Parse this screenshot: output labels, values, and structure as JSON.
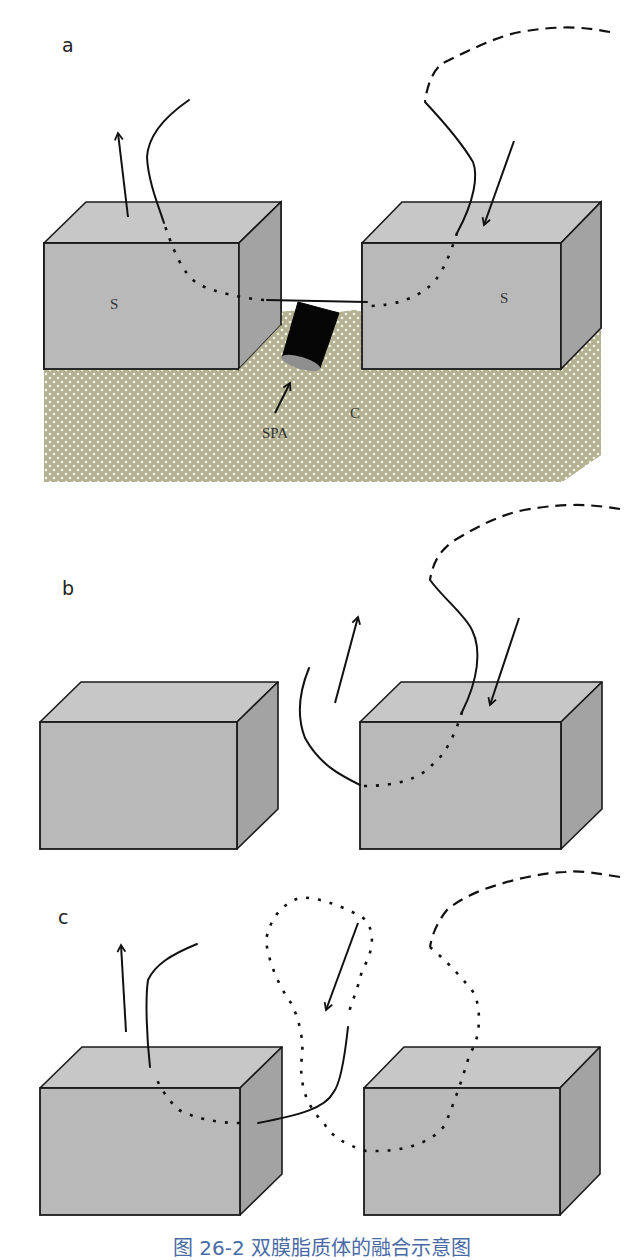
{
  "figure": {
    "caption": "图 26-2  双膜脂质体的融合示意图",
    "caption_note": "caption is clipped at bottom edge of screenshot; only the top sliver is visible",
    "colors": {
      "box_top": "#c7c7c7",
      "box_front": "#b9b9b9",
      "box_side": "#a3a3a3",
      "box_stroke": "#1a1a1a",
      "substrate": "#b4b293",
      "substrate_dot": "#f4f4e8",
      "line": "#111111",
      "cylinder": "#050505",
      "cylinder_base": "#8f8f8f",
      "caption": "#4a6aa6"
    },
    "panels": [
      {
        "id": "a",
        "label": "a",
        "label_pos": [
          62,
          52
        ],
        "substrate": {
          "points": [
            [
              44,
              369
            ],
            [
              238,
              369
            ],
            [
              280,
              325
            ],
            [
              280,
              312
            ],
            [
              300,
              310
            ],
            [
              340,
              312
            ],
            [
              355,
              310
            ],
            [
              362,
              312
            ],
            [
              362,
              369
            ],
            [
              561,
              369
            ],
            [
              601,
              328
            ],
            [
              601,
              455
            ],
            [
              562,
              482
            ],
            [
              44,
              482
            ]
          ]
        },
        "boxes": [
          {
            "x": 44,
            "y": 243,
            "w": 195,
            "h": 126,
            "dx": 42,
            "dy": -41,
            "clip_side_to": 325
          },
          {
            "x": 362,
            "y": 243,
            "w": 199,
            "h": 126,
            "dx": 40,
            "dy": -41,
            "clip_side_to": 328
          }
        ],
        "cylinder": {
          "points": [
            [
              298,
              302
            ],
            [
              339,
              313
            ],
            [
              320,
              368
            ],
            [
              282,
              358
            ]
          ],
          "base": {
            "cx": 301,
            "cy": 363,
            "rx": 20,
            "ry": 6,
            "angle": 17
          }
        },
        "texts": [
          {
            "text": "S",
            "x": 110,
            "y": 309,
            "cls": "serif"
          },
          {
            "text": "S",
            "x": 500,
            "y": 303,
            "cls": "serif"
          },
          {
            "text": "SPA",
            "x": 262,
            "y": 438,
            "cls": "serif"
          },
          {
            "text": "C",
            "x": 350,
            "y": 418,
            "cls": "serif"
          }
        ],
        "paths": [
          {
            "style": "dashed",
            "d": "M610,32 C585,27 560,25 520,32 C495,37 470,50 443,63 C433,70 427,85 425,102"
          },
          {
            "style": "solid",
            "d": "M425,102 C440,118 460,140 473,162 C478,175 475,200 457,233"
          },
          {
            "style": "dotted",
            "d": "M457,233 C450,255 440,280 427,288 C415,298 395,306 367,306"
          },
          {
            "style": "solid",
            "d": "M367,302 L267,300"
          },
          {
            "style": "dotted",
            "d": "M264,300 C240,298 215,292 200,285 C188,278 178,265 164,223"
          },
          {
            "style": "solid",
            "d": "M164,223 C158,205 148,180 147,157 C148,140 160,120 189,100"
          }
        ],
        "arrows": [
          {
            "from": [
              128,
              217
            ],
            "to": [
              118,
              133
            ]
          },
          {
            "from": [
              514,
              141
            ],
            "to": [
              484,
              225
            ]
          },
          {
            "from": [
              275,
              413
            ],
            "to": [
              290,
              383
            ]
          }
        ]
      },
      {
        "id": "b",
        "label": "b",
        "label_pos": [
          62,
          595
        ],
        "boxes": [
          {
            "x": 40,
            "y": 722,
            "w": 197,
            "h": 127,
            "dx": 41,
            "dy": -40
          },
          {
            "x": 360,
            "y": 722,
            "w": 201,
            "h": 127,
            "dx": 41,
            "dy": -40
          }
        ],
        "texts": [],
        "paths": [
          {
            "style": "dashed",
            "d": "M620,509 C595,505 570,502 524,510 C500,515 480,525 455,540 C440,550 433,562 430,580"
          },
          {
            "style": "solid",
            "d": "M430,580 C445,600 465,615 472,630 C482,650 478,680 462,712"
          },
          {
            "style": "dotted",
            "d": "M462,712 C455,735 445,755 432,765 C420,778 400,786 362,786"
          },
          {
            "style": "solid",
            "d": "M360,785 C340,775 320,765 305,738 C296,715 300,690 309,668"
          }
        ],
        "arrows": [
          {
            "from": [
              335,
              703
            ],
            "to": [
              358,
              617
            ]
          },
          {
            "from": [
              519,
              618
            ],
            "to": [
              490,
              705
            ]
          }
        ]
      },
      {
        "id": "c",
        "label": "c",
        "label_pos": [
          58,
          924
        ],
        "boxes": [
          {
            "x": 40,
            "y": 1088,
            "w": 200,
            "h": 127,
            "dx": 42,
            "dy": -41
          },
          {
            "x": 364,
            "y": 1088,
            "w": 196,
            "h": 127,
            "dx": 40,
            "dy": -41
          }
        ],
        "texts": [],
        "paths": [
          {
            "style": "dashed",
            "d": "M620,877 C600,874 580,870 565,872 C540,873 510,880 482,890 C465,897 452,905 447,910 C437,922 432,935 430,947"
          },
          {
            "style": "dotted",
            "d": "M430,947 C445,960 460,975 474,993 C482,1010 480,1040 470,1053 C462,1080 455,1100 445,1125 C430,1145 400,1152 366,1151 C345,1145 330,1135 324,1123 C305,1105 301,1085 301,1063 C305,1045 300,1020 291,1003 C278,985 268,960 266,940 C270,920 280,905 299,898 C315,896 340,905 362,917 C378,930 372,955 362,970 C358,990 350,1005 348,1017"
          },
          {
            "style": "solid",
            "d": "M348,1027 C345,1055 340,1085 333,1093 C325,1108 300,1115 258,1123"
          },
          {
            "style": "dotted",
            "d": "M240,1123 C215,1123 195,1118 179,1110 C168,1100 160,1088 154,1073"
          },
          {
            "style": "solid",
            "d": "M150,1067 C147,1040 145,1000 148,980 C155,965 170,955 197,944"
          }
        ],
        "arrows": [
          {
            "from": [
              126,
              1032
            ],
            "to": [
              121,
              945
            ]
          },
          {
            "from": [
              358,
              923
            ],
            "to": [
              326,
              1010
            ]
          }
        ]
      }
    ]
  }
}
